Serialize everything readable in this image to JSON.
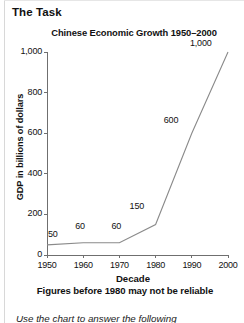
{
  "page": {
    "heading": "The Task",
    "instruction": "Use the chart to answer the following"
  },
  "chart_data": {
    "type": "line",
    "title": "Chinese Economic Growth 1950–2000",
    "xlabel": "Decade",
    "ylabel": "GDP in billions of dollars",
    "note": "Figures before 1980 may not be reliable",
    "categories": [
      "1950",
      "1960",
      "1970",
      "1980",
      "1990",
      "2000"
    ],
    "x": [
      1950,
      1960,
      1970,
      1980,
      1990,
      2000
    ],
    "values": [
      50,
      60,
      60,
      150,
      600,
      1000
    ],
    "point_labels": [
      "50",
      "60",
      "60",
      "150",
      "600",
      "1,000"
    ],
    "xlim": [
      1950,
      2000
    ],
    "ylim": [
      0,
      1000
    ],
    "ytick_values": [
      0,
      200,
      400,
      600,
      800,
      1000
    ],
    "ytick_labels": [
      "0",
      "200",
      "400",
      "600",
      "800",
      "1,000"
    ],
    "xtick_labels": [
      "1950",
      "1960",
      "1970",
      "1980",
      "1990",
      "2000"
    ],
    "grid": false,
    "legend": false,
    "line_color": "#8a8a8a",
    "axis_color": "#6f6f6f",
    "text_color": "#111111"
  }
}
